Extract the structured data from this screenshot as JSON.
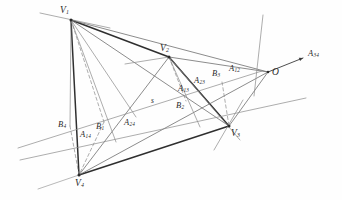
{
  "figure": {
    "kind": "projective-geometry-diagram",
    "width": 342,
    "height": 200,
    "background_color": "#fefefe",
    "ink_color": "#2a2a2a",
    "light_ink_color": "#8a8a8a",
    "caption": ""
  },
  "vertices": [
    {
      "id": "V1",
      "label": "V",
      "sub": "1",
      "x": 71,
      "y": 20,
      "label_x": 60,
      "label_y": 6
    },
    {
      "id": "V2",
      "label": "V",
      "sub": "2",
      "x": 169,
      "y": 57,
      "label_x": 160,
      "label_y": 44
    },
    {
      "id": "V3",
      "label": "V",
      "sub": "3",
      "x": 229,
      "y": 126,
      "label_x": 231,
      "label_y": 129
    },
    {
      "id": "V4",
      "label": "V",
      "sub": "4",
      "x": 79,
      "y": 175,
      "label_x": 75,
      "label_y": 179
    }
  ],
  "center": {
    "id": "O",
    "label": "O",
    "sub": "",
    "x": 268,
    "y": 72,
    "label_x": 272,
    "label_y": 68
  },
  "axis_point": {
    "id": "A34",
    "label": "A",
    "sub": "34",
    "x": 305,
    "y": 57,
    "label_x": 308,
    "label_y": 49
  },
  "intersection_points": [
    {
      "id": "A12",
      "label": "A",
      "sub": "12",
      "x": 241,
      "y": 77,
      "label_x": 229,
      "label_y": 64
    },
    {
      "id": "A13",
      "label": "A",
      "sub": "13",
      "x": 190,
      "y": 95,
      "label_x": 178,
      "label_y": 84
    },
    {
      "id": "A14",
      "label": "A",
      "sub": "14",
      "x": 88,
      "y": 127,
      "label_x": 80,
      "label_y": 130
    },
    {
      "id": "A23",
      "label": "A",
      "sub": "23",
      "x": 206,
      "y": 90,
      "label_x": 194,
      "label_y": 76
    },
    {
      "id": "A24",
      "label": "A",
      "sub": "24",
      "x": 136,
      "y": 117,
      "label_x": 124,
      "label_y": 118
    },
    {
      "id": "B1",
      "label": "B",
      "sub": "1",
      "x": 104,
      "y": 122,
      "label_x": 96,
      "label_y": 122
    },
    {
      "id": "B2",
      "label": "B",
      "sub": "2",
      "x": 186,
      "y": 101,
      "label_x": 176,
      "label_y": 101
    },
    {
      "id": "B3",
      "label": "B",
      "sub": "3",
      "x": 222,
      "y": 82,
      "label_x": 212,
      "label_y": 69
    },
    {
      "id": "B4",
      "label": "B",
      "sub": "4",
      "x": 70,
      "y": 126,
      "label_x": 58,
      "label_y": 120
    }
  ],
  "line_labels": [
    {
      "id": "s",
      "label": "s",
      "sub": "",
      "x": 151,
      "y": 97
    }
  ],
  "solid_segments": [
    {
      "name": "V1-V2",
      "x1": 71,
      "y1": 20,
      "x2": 169,
      "y2": 57,
      "w": 1.5,
      "c": "#2f2f2f"
    },
    {
      "name": "V2-V3",
      "x1": 169,
      "y1": 57,
      "x2": 229,
      "y2": 126,
      "w": 1.5,
      "c": "#2f2f2f"
    },
    {
      "name": "V3-V4",
      "x1": 229,
      "y1": 126,
      "x2": 79,
      "y2": 175,
      "w": 1.5,
      "c": "#2f2f2f"
    },
    {
      "name": "V4-V1",
      "x1": 79,
      "y1": 175,
      "x2": 71,
      "y2": 20,
      "w": 1.5,
      "c": "#2f2f2f"
    },
    {
      "name": "V1-V3",
      "x1": 71,
      "y1": 20,
      "x2": 229,
      "y2": 126,
      "w": 0.8,
      "c": "#6e6e6e"
    },
    {
      "name": "V2-V4",
      "x1": 169,
      "y1": 57,
      "x2": 79,
      "y2": 175,
      "w": 0.8,
      "c": "#6e6e6e"
    },
    {
      "name": "V1-O",
      "x1": 71,
      "y1": 20,
      "x2": 268,
      "y2": 72,
      "w": 0.8,
      "c": "#6e6e6e"
    },
    {
      "name": "V2-O",
      "x1": 169,
      "y1": 57,
      "x2": 268,
      "y2": 72,
      "w": 0.8,
      "c": "#6e6e6e"
    },
    {
      "name": "V3-O",
      "x1": 229,
      "y1": 126,
      "x2": 268,
      "y2": 72,
      "w": 0.8,
      "c": "#6e6e6e"
    },
    {
      "name": "V4-O",
      "x1": 79,
      "y1": 175,
      "x2": 268,
      "y2": 72,
      "w": 0.8,
      "c": "#6e6e6e"
    },
    {
      "name": "V1-B1-ext",
      "x1": 71,
      "y1": 20,
      "x2": 116,
      "y2": 142,
      "w": 0.7,
      "c": "#8a8a8a"
    },
    {
      "name": "V2-B2-ext",
      "x1": 169,
      "y1": 57,
      "x2": 200,
      "y2": 127,
      "w": 0.7,
      "c": "#8a8a8a"
    },
    {
      "name": "V4-V2-ext-up",
      "x1": 125,
      "y1": 64,
      "x2": 169,
      "y2": 57,
      "w": 0.7,
      "c": "#8a8a8a"
    },
    {
      "name": "V2-A13-V3",
      "x1": 169,
      "y1": 57,
      "x2": 240,
      "y2": 140,
      "w": 0.7,
      "c": "#8a8a8a"
    },
    {
      "name": "line-through-V1-left",
      "x1": 40,
      "y1": 13,
      "x2": 110,
      "y2": 28,
      "w": 0.7,
      "c": "#8a8a8a"
    },
    {
      "name": "line-through-O-steep",
      "x1": 263,
      "y1": 15,
      "x2": 254,
      "y2": 96,
      "w": 0.7,
      "c": "#8a8a8a"
    },
    {
      "name": "line-through-V3-steep",
      "x1": 243,
      "y1": 100,
      "x2": 214,
      "y2": 150,
      "w": 0.7,
      "c": "#8a8a8a"
    },
    {
      "name": "line-s",
      "x1": 18,
      "y1": 148,
      "x2": 262,
      "y2": 71,
      "w": 0.7,
      "c": "#8a8a8a"
    },
    {
      "name": "line-s-parallel",
      "x1": 20,
      "y1": 160,
      "x2": 306,
      "y2": 98,
      "w": 0.7,
      "c": "#8a8a8a"
    },
    {
      "name": "V4-tail-lower-left",
      "x1": 79,
      "y1": 175,
      "x2": 38,
      "y2": 189,
      "w": 0.7,
      "c": "#9a9a9a"
    },
    {
      "name": "B4-V1-ray",
      "x1": 71,
      "y1": 20,
      "x2": 70,
      "y2": 126,
      "w": 0.7,
      "c": "#8a8a8a"
    },
    {
      "name": "A24-V1-ray",
      "x1": 71,
      "y1": 20,
      "x2": 136,
      "y2": 117,
      "w": 0.7,
      "c": "#8a8a8a"
    }
  ],
  "dashed_segments": [
    {
      "name": "V1-B1-dashed",
      "x1": 71,
      "y1": 20,
      "x2": 104,
      "y2": 122,
      "w": 0.7,
      "c": "#8a8a8a"
    },
    {
      "name": "B1-V4-dashed",
      "x1": 104,
      "y1": 122,
      "x2": 79,
      "y2": 175,
      "w": 0.7,
      "c": "#8a8a8a"
    },
    {
      "name": "B4-V4-dashed",
      "x1": 70,
      "y1": 126,
      "x2": 79,
      "y2": 175,
      "w": 0.7,
      "c": "#8a8a8a"
    },
    {
      "name": "V2-B2-dashed",
      "x1": 169,
      "y1": 57,
      "x2": 186,
      "y2": 101,
      "w": 0.7,
      "c": "#8a8a8a"
    },
    {
      "name": "B3-V3-dashed",
      "x1": 222,
      "y1": 82,
      "x2": 229,
      "y2": 126,
      "w": 0.7,
      "c": "#8a8a8a"
    }
  ],
  "arrow": {
    "name": "axis-arrow-A34",
    "x1": 268,
    "y1": 72,
    "x2": 303,
    "y2": 58,
    "head_size": 4.2,
    "c": "#3a3a3a"
  }
}
